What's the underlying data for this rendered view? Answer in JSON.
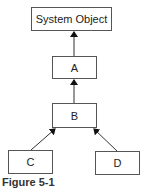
{
  "diagram": {
    "nodes": [
      {
        "id": "system-object",
        "label": "System Object"
      },
      {
        "id": "a",
        "label": "A"
      },
      {
        "id": "b",
        "label": "B"
      },
      {
        "id": "c",
        "label": "C"
      },
      {
        "id": "d",
        "label": "D"
      }
    ],
    "edges": [
      {
        "from": "a",
        "to": "system-object"
      },
      {
        "from": "b",
        "to": "a"
      },
      {
        "from": "c",
        "to": "b"
      },
      {
        "from": "d",
        "to": "b"
      }
    ],
    "caption": "Figure 5-1"
  }
}
